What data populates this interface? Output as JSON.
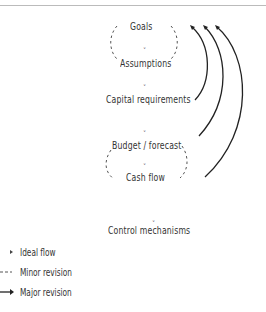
{
  "diagram": {
    "title_fragment": "",
    "nodes": [
      {
        "id": "goals",
        "label": "Goals"
      },
      {
        "id": "assumptions",
        "label": "Assumptions"
      },
      {
        "id": "capital",
        "label": "Capital requirements"
      },
      {
        "id": "budget",
        "label": "Budget / forecast"
      },
      {
        "id": "cashflow",
        "label": "Cash flow"
      },
      {
        "id": "control",
        "label": "Control mechanisms"
      }
    ],
    "edges": [
      {
        "from": "goals",
        "to": "assumptions",
        "type": "ideal"
      },
      {
        "from": "assumptions",
        "to": "capital",
        "type": "ideal"
      },
      {
        "from": "capital",
        "to": "budget",
        "type": "ideal"
      },
      {
        "from": "budget",
        "to": "cashflow",
        "type": "ideal"
      },
      {
        "from": "cashflow",
        "to": "control",
        "type": "ideal"
      },
      {
        "from": "goals",
        "to": "assumptions",
        "type": "minor",
        "loop": true
      },
      {
        "from": "budget",
        "to": "cashflow",
        "type": "minor",
        "loop": true
      },
      {
        "from": "capital",
        "to": "goals",
        "type": "major"
      },
      {
        "from": "budget",
        "to": "goals",
        "type": "major"
      },
      {
        "from": "cashflow",
        "to": "goals",
        "type": "major"
      }
    ],
    "colors": {
      "text": "#333333",
      "line": "#222222",
      "dash": "#555555"
    }
  },
  "legend": {
    "items": [
      {
        "symbol": "small-arrowhead",
        "label": "Ideal flow"
      },
      {
        "symbol": "dashed-line",
        "label": "Minor revision"
      },
      {
        "symbol": "solid-arrow",
        "label": "Major revision"
      }
    ]
  }
}
